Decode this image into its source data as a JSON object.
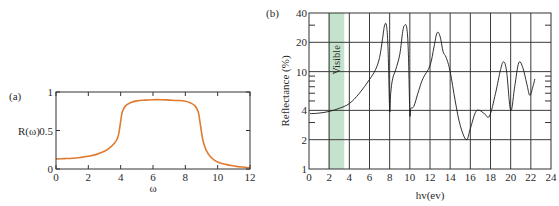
{
  "chart_data": [
    {
      "panel": "(a)",
      "type": "line",
      "title": "",
      "xlabel": "ω",
      "ylabel": "R(ω)",
      "xlim": [
        0,
        12
      ],
      "ylim": [
        0,
        1
      ],
      "xticks": [
        0,
        2,
        4,
        6,
        8,
        10,
        12
      ],
      "yticks": [
        0,
        0.5,
        1
      ],
      "ytick_labels": [
        "0",
        "0.5",
        "1"
      ],
      "grid": false,
      "line_color": "#e07a2e",
      "series": [
        {
          "name": "R(ω)",
          "x": [
            0,
            0.5,
            1,
            1.5,
            2,
            2.5,
            3,
            3.3,
            3.6,
            3.8,
            3.9,
            4.0,
            4.1,
            4.3,
            4.6,
            5,
            5.5,
            6,
            6.5,
            7,
            7.5,
            8,
            8.3,
            8.6,
            8.8,
            8.9,
            9.0,
            9.1,
            9.3,
            9.6,
            10,
            10.5,
            11,
            11.5,
            12
          ],
          "y": [
            0.13,
            0.135,
            0.14,
            0.15,
            0.165,
            0.19,
            0.23,
            0.27,
            0.33,
            0.4,
            0.48,
            0.62,
            0.74,
            0.82,
            0.86,
            0.885,
            0.895,
            0.9,
            0.9,
            0.895,
            0.89,
            0.88,
            0.86,
            0.82,
            0.74,
            0.62,
            0.48,
            0.36,
            0.24,
            0.15,
            0.09,
            0.06,
            0.04,
            0.025,
            0.015
          ]
        }
      ]
    },
    {
      "panel": "(b)",
      "type": "line",
      "title": "",
      "xlabel": "hv(ev)",
      "ylabel": "Reflectance (%)",
      "xlim": [
        0,
        24
      ],
      "ylim": [
        1,
        40
      ],
      "yscale": "log",
      "xticks": [
        0,
        2,
        4,
        6,
        8,
        10,
        12,
        14,
        16,
        18,
        20,
        22,
        24
      ],
      "yticks": [
        1,
        2,
        4,
        10,
        20,
        40
      ],
      "grid": true,
      "line_color": "#1a1a1a",
      "annotations": [
        {
          "text": "Visible",
          "x_range": [
            1.9,
            3.5
          ],
          "fill": "#c5e3cc"
        }
      ],
      "series": [
        {
          "name": "Reflectance",
          "x": [
            0.1,
            1,
            2,
            3,
            4,
            5,
            6,
            6.6,
            7.0,
            7.3,
            7.5,
            7.7,
            7.85,
            8.0,
            8.1,
            8.3,
            8.6,
            9.0,
            9.3,
            9.5,
            9.7,
            9.85,
            10.0,
            10.1,
            10.4,
            10.8,
            11.3,
            12.0,
            12.4,
            12.7,
            13.0,
            13.3,
            13.6,
            14.0,
            14.5,
            15.0,
            15.6,
            16.0,
            16.5,
            16.9,
            17.4,
            17.9,
            18.5,
            19.0,
            19.3,
            19.6,
            20.0,
            20.4,
            20.8,
            21.2,
            21.6,
            21.9,
            22.2,
            22.4
          ],
          "y": [
            3.7,
            3.75,
            3.9,
            4.2,
            4.7,
            6.0,
            8.3,
            10.5,
            14,
            22,
            30,
            29,
            16,
            4.0,
            6.0,
            8.5,
            10.5,
            15,
            26,
            30,
            28,
            16,
            3.8,
            4.2,
            4.4,
            6.0,
            8.5,
            11.5,
            18,
            25,
            23,
            16,
            14,
            10,
            5.0,
            2.8,
            2.0,
            2.6,
            3.8,
            4.0,
            3.7,
            3.5,
            6.0,
            10.5,
            12.6,
            10,
            4.0,
            7,
            12.3,
            11,
            7.5,
            5.7,
            7.0,
            8.4
          ]
        }
      ]
    }
  ]
}
